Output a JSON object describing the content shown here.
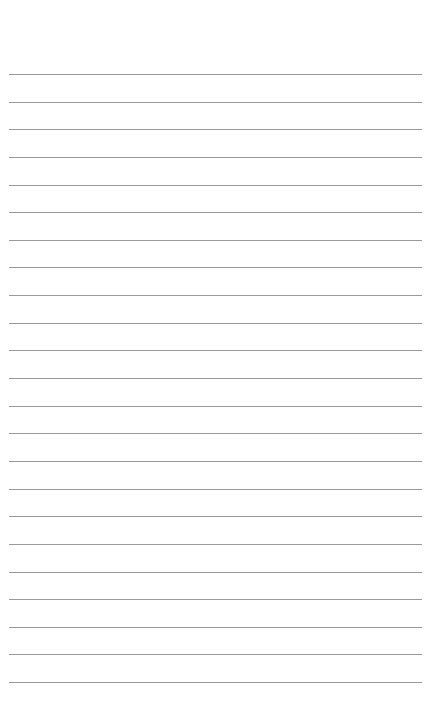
{
  "page": {
    "type": "lined-paper",
    "background": "#ffffff",
    "rule_color": "#9a9a9a",
    "rule_count": 23,
    "first_rule_y": 74,
    "rule_spacing": 27.64,
    "rule_left": 9,
    "rule_width": 413
  }
}
